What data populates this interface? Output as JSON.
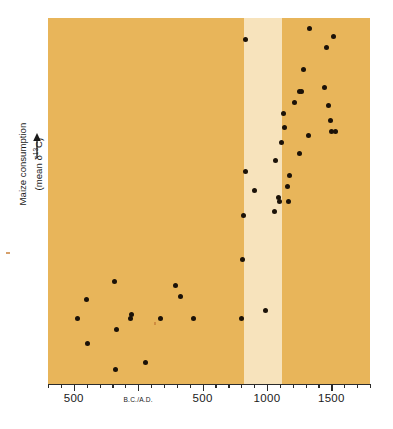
{
  "chart": {
    "type": "scatter",
    "title": "",
    "y_axis": {
      "label_line1": "Maize consumption",
      "label_line2_prefix": "(mean δ",
      "label_line2_sup": "13",
      "label_line2_suffix": "C)",
      "arrow": "up-arrow-icon",
      "ticks": [],
      "tick_labels": []
    },
    "x_axis": {
      "label": "",
      "tick_labels": [
        "500",
        "B.C./A.D.",
        "500",
        "1000",
        "1500"
      ],
      "range_start": -700,
      "range_end": 1800,
      "major_ticks": [
        -500,
        0,
        500,
        1000,
        1500
      ],
      "minor_tick_interval": 100
    },
    "bands": [
      {
        "name": "left-amber-band",
        "color": "#e8b55a",
        "start": -700,
        "end": 820
      },
      {
        "name": "highlight-pale-band",
        "color": "#f7e3bc",
        "start": 820,
        "end": 1120
      },
      {
        "name": "right-amber-band",
        "color": "#e8b55a",
        "start": 1120,
        "end": 1800
      }
    ],
    "colors": {
      "band_amber": "#e8b55a",
      "band_pale": "#f7e3bc",
      "point": "#1b1208",
      "axis": "#2b2b2b",
      "text": "#1a1a1a",
      "page": "#ffffff"
    }
  },
  "chart_data": {
    "type": "scatter",
    "title": "",
    "xlabel": "",
    "ylabel": "Maize consumption (mean δ13C)",
    "xlim": [
      -700,
      1800
    ],
    "ylim": [
      0,
      100
    ],
    "grid": false,
    "legend": null,
    "xtick_labels": [
      "500",
      "B.C./A.D.",
      "500",
      "1000",
      "1500"
    ],
    "xticks": [
      -500,
      0,
      500,
      1000,
      1500
    ],
    "annotations": [
      "Pale vertical band highlights approximately A.D. 820–1120",
      "Y axis is unlabelled; arrow indicates increasing maize consumption"
    ],
    "series": [
      {
        "name": "Maize consumption by site",
        "marker": "filled-circle",
        "color": "#1b1208",
        "points": [
          {
            "x": -470,
            "y": 18
          },
          {
            "x": -400,
            "y": 23
          },
          {
            "x": -395,
            "y": 11
          },
          {
            "x": -180,
            "y": 28
          },
          {
            "x": -175,
            "y": 4
          },
          {
            "x": -170,
            "y": 15
          },
          {
            "x": -60,
            "y": 18
          },
          {
            "x": -55,
            "y": 19
          },
          {
            "x": 60,
            "y": 6
          },
          {
            "x": 175,
            "y": 18
          },
          {
            "x": 290,
            "y": 27
          },
          {
            "x": 330,
            "y": 24
          },
          {
            "x": 430,
            "y": 18
          },
          {
            "x": 800,
            "y": 18
          },
          {
            "x": 810,
            "y": 34
          },
          {
            "x": 820,
            "y": 46
          },
          {
            "x": 830,
            "y": 58
          },
          {
            "x": 835,
            "y": 94
          },
          {
            "x": 900,
            "y": 53
          },
          {
            "x": 990,
            "y": 20
          },
          {
            "x": 1060,
            "y": 47
          },
          {
            "x": 1065,
            "y": 61
          },
          {
            "x": 1090,
            "y": 51
          },
          {
            "x": 1100,
            "y": 50
          },
          {
            "x": 1110,
            "y": 66
          },
          {
            "x": 1130,
            "y": 74
          },
          {
            "x": 1135,
            "y": 70
          },
          {
            "x": 1160,
            "y": 54
          },
          {
            "x": 1165,
            "y": 50
          },
          {
            "x": 1175,
            "y": 57
          },
          {
            "x": 1210,
            "y": 77
          },
          {
            "x": 1250,
            "y": 63
          },
          {
            "x": 1255,
            "y": 80
          },
          {
            "x": 1270,
            "y": 80
          },
          {
            "x": 1280,
            "y": 86
          },
          {
            "x": 1320,
            "y": 68
          },
          {
            "x": 1330,
            "y": 97
          },
          {
            "x": 1450,
            "y": 81
          },
          {
            "x": 1460,
            "y": 92
          },
          {
            "x": 1480,
            "y": 76
          },
          {
            "x": 1490,
            "y": 72
          },
          {
            "x": 1500,
            "y": 69
          },
          {
            "x": 1520,
            "y": 95
          },
          {
            "x": 1530,
            "y": 69
          }
        ]
      }
    ]
  }
}
